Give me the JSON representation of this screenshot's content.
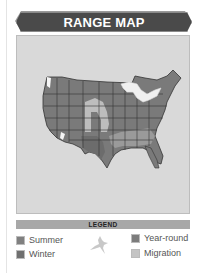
{
  "header": {
    "title": "RANGE MAP"
  },
  "map": {
    "region": "United States",
    "colors": {
      "background": "#d9d9d9",
      "summer": "#7a7a7a",
      "winter": "#6e6e6e",
      "year_round": "#767676",
      "migration": "#bdbdbd",
      "state_borders": "#333333",
      "lakes": "#f0f0f0"
    }
  },
  "legend": {
    "title": "LEGEND",
    "items": [
      {
        "label": "Summer",
        "color": "#808080"
      },
      {
        "label": "Winter",
        "color": "#6f6f6f"
      },
      {
        "label": "Year-round",
        "color": "#7c7c7c"
      },
      {
        "label": "Migration",
        "color": "#c4c4c4"
      }
    ],
    "icon": "bird-silhouette-icon"
  }
}
